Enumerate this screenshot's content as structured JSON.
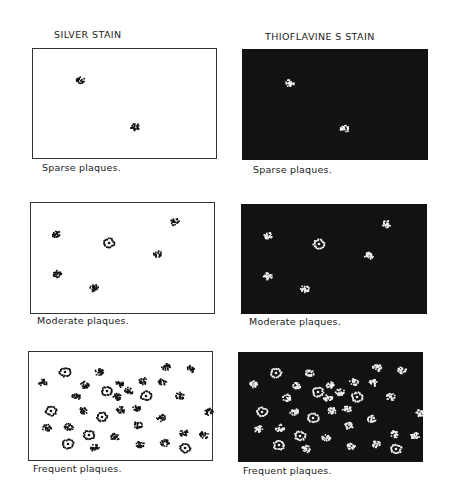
{
  "columns": {
    "silver": {
      "title": "SILVER STAIN"
    },
    "thio": {
      "title": "THIOFLAVINE S STAIN"
    }
  },
  "rows": [
    {
      "caption": "Sparse plaques."
    },
    {
      "caption": "Moderate plaques."
    },
    {
      "caption": "Frequent plaques."
    }
  ],
  "colors": {
    "silver_bg": "#ffffff",
    "silver_plaque": "#111111",
    "thio_bg": "#121212",
    "thio_plaque": "#f2f2f2"
  },
  "plaques": {
    "sparse_silver": [
      [
        80,
        80,
        "d"
      ],
      [
        135,
        127,
        "d"
      ]
    ],
    "sparse_thio": [
      [
        290,
        83,
        "d"
      ],
      [
        345,
        129,
        "d"
      ]
    ],
    "moderate_silver": [
      [
        56,
        234,
        "d"
      ],
      [
        109,
        243,
        "c"
      ],
      [
        175,
        222,
        "d"
      ],
      [
        158,
        254,
        "d"
      ],
      [
        57,
        274,
        "d"
      ],
      [
        94,
        288,
        "d"
      ]
    ],
    "moderate_thio": [
      [
        268,
        236,
        "d"
      ],
      [
        319,
        244,
        "c"
      ],
      [
        387,
        224,
        "d"
      ],
      [
        369,
        256,
        "d"
      ],
      [
        268,
        276,
        "d"
      ],
      [
        305,
        289,
        "d"
      ]
    ],
    "frequent_silver": [
      [
        65,
        372,
        "c"
      ],
      [
        99,
        372,
        "d"
      ],
      [
        166,
        367,
        "d"
      ],
      [
        191,
        369,
        "d"
      ],
      [
        43,
        383,
        "d"
      ],
      [
        85,
        385,
        "d"
      ],
      [
        119,
        384,
        "d"
      ],
      [
        107,
        391,
        "c"
      ],
      [
        143,
        381,
        "d"
      ],
      [
        162,
        382,
        "d"
      ],
      [
        129,
        391,
        "d"
      ],
      [
        76,
        397,
        "d"
      ],
      [
        117,
        397,
        "d"
      ],
      [
        146,
        396,
        "c"
      ],
      [
        180,
        396,
        "d"
      ],
      [
        51,
        411,
        "c"
      ],
      [
        83,
        411,
        "d"
      ],
      [
        121,
        410,
        "d"
      ],
      [
        136,
        408,
        "d"
      ],
      [
        102,
        417,
        "c"
      ],
      [
        209,
        412,
        "d"
      ],
      [
        161,
        418,
        "d"
      ],
      [
        47,
        428,
        "d"
      ],
      [
        69,
        427,
        "d"
      ],
      [
        138,
        425,
        "d"
      ],
      [
        89,
        435,
        "c"
      ],
      [
        115,
        437,
        "d"
      ],
      [
        184,
        433,
        "d"
      ],
      [
        204,
        435,
        "d"
      ],
      [
        68,
        444,
        "c"
      ],
      [
        95,
        448,
        "d"
      ],
      [
        140,
        445,
        "d"
      ],
      [
        165,
        443,
        "d"
      ],
      [
        185,
        448,
        "c"
      ]
    ],
    "frequent_thio_offset": [
      211,
      1
    ]
  }
}
